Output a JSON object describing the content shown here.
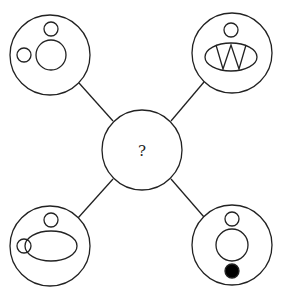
{
  "puzzle": {
    "center": {
      "label": "?"
    },
    "nodes": [
      {
        "position": "top-left",
        "contents": [
          "small circle top",
          "large circle center",
          "small circle left"
        ]
      },
      {
        "position": "top-right",
        "contents": [
          "small circle top",
          "ellipse center",
          "letter W inside ellipse"
        ],
        "letter": "W"
      },
      {
        "position": "bottom-left",
        "contents": [
          "small circle top",
          "ellipse center",
          "small circle overlapping ellipse left"
        ]
      },
      {
        "position": "bottom-right",
        "contents": [
          "small circle top",
          "large circle center",
          "filled black circle bottom"
        ]
      }
    ]
  },
  "colors": {
    "stroke": "#222222",
    "fill": "#000000",
    "background": "#ffffff"
  }
}
